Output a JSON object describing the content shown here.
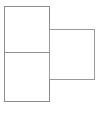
{
  "canvas": {
    "width": 98,
    "height": 115,
    "background_color": "#ffffff",
    "title": "Two overlapping rectangles outline diagram"
  },
  "style": {
    "stroke_color": "#8c8c8c",
    "stroke_color_light": "#a8a8a8",
    "fill_color": "#ffffff",
    "stroke_width": 1
  },
  "shapes": {
    "left_rectangle": {
      "name": "left-rectangle",
      "x": 4,
      "y": 6,
      "width": 45,
      "height": 95,
      "stroke": "#8c8c8c",
      "fill": "#ffffff"
    },
    "right_rectangle": {
      "name": "right-rectangle",
      "x": 49,
      "y": 29,
      "width": 45,
      "height": 50,
      "stroke": "#9a9a9a",
      "fill": "#ffffff"
    },
    "divider": {
      "name": "horizontal-divider",
      "x1": 4,
      "y1": 52,
      "x2": 49,
      "y2": 52,
      "stroke": "#8c8c8c"
    }
  }
}
